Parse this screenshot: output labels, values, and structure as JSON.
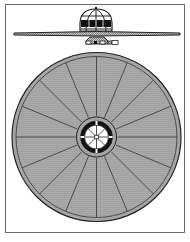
{
  "figure": {
    "title": "",
    "views": [
      {
        "name": "side-view",
        "description": "Saucer craft in profile with domed cockpit and underside pod"
      },
      {
        "name": "top-view",
        "description": "Saucer disc seen from above with radial segments and central hub"
      }
    ],
    "colors": {
      "outline": "#2a2a2a",
      "hatch_fill": "#a9a9a9",
      "dark_fill": "#111111",
      "background": "#ffffff",
      "frame": "#6a6a6a"
    },
    "top_view": {
      "outer_spokes": 16,
      "hub_spokes": 8
    }
  }
}
